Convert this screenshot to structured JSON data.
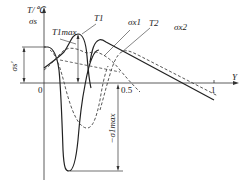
{
  "diagram": {
    "type": "temperature-stress distribution diagram",
    "axes": {
      "y_axis_label_line1": "T/℃",
      "y_axis_label_line2": "σs",
      "x_axis_label": "Y",
      "origin_label": "0",
      "tick_half": "0.5",
      "tick_one": "1"
    },
    "labels": {
      "T1max": "T1max",
      "T1": "T1",
      "sigma_x1": "σx1",
      "T2": "T2",
      "sigma_x2": "σx2",
      "sigma_s_prime": "σs'",
      "neg_sigma_1max": "−σ1max"
    },
    "curves": [
      {
        "name": "T1",
        "style": "solid",
        "description": "temperature peak near Y≈0.2"
      },
      {
        "name": "T2",
        "style": "solid",
        "description": "temperature rise then linear decay toward Y≈1"
      },
      {
        "name": "σx1",
        "style": "dashed",
        "description": "stress curve with trough near Y≈0.25"
      },
      {
        "name": "σx2",
        "style": "dashed",
        "description": "stress curve with peak near Y≈0.55"
      },
      {
        "name": "σ solid deep",
        "style": "solid",
        "description": "stress curve with deep trough −σ1max near Y≈0.15"
      }
    ],
    "colors": {
      "line": "#222222",
      "background": "#ffffff"
    }
  }
}
